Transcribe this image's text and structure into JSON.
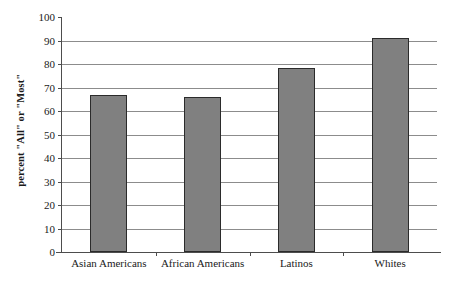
{
  "chart_data": {
    "type": "bar",
    "title": "",
    "subtitle": "",
    "xlabel": "",
    "ylabel": "percent \"All\" or \"Most\"",
    "categories": [
      "Asian Americans",
      "African Americans",
      "Latinos",
      "Whites"
    ],
    "values": [
      67,
      66,
      78.5,
      91
    ],
    "ylim": [
      0,
      100
    ],
    "ytick_labels": [
      "0",
      "10",
      "20",
      "30",
      "40",
      "50",
      "60",
      "70",
      "80",
      "90",
      "100"
    ],
    "ytick_values": [
      0,
      10,
      20,
      30,
      40,
      50,
      60,
      70,
      80,
      90,
      100
    ],
    "grid": "horizontal",
    "legend": "none",
    "bar_color": "#808080",
    "bar_edge_color": "#2b2b2b",
    "axis_color": "#4d4d4d",
    "grid_color": "#8c8c8c",
    "background": "#ffffff",
    "annotations": []
  }
}
